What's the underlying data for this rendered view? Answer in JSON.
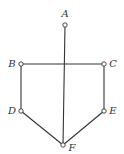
{
  "diagram": {
    "type": "graph",
    "nodes": [
      {
        "id": "A",
        "label": "A",
        "x": 65,
        "y": 25,
        "lx": 65,
        "ly": 17
      },
      {
        "id": "B",
        "label": "B",
        "x": 21,
        "y": 64,
        "lx": 12,
        "ly": 67
      },
      {
        "id": "C",
        "label": "C",
        "x": 104,
        "y": 64,
        "lx": 113,
        "ly": 67
      },
      {
        "id": "D",
        "label": "D",
        "x": 21,
        "y": 111,
        "lx": 12,
        "ly": 114
      },
      {
        "id": "E",
        "label": "E",
        "x": 104,
        "y": 111,
        "lx": 113,
        "ly": 114
      },
      {
        "id": "F",
        "label": "F",
        "x": 63,
        "y": 145,
        "lx": 72,
        "ly": 151
      }
    ],
    "edges": [
      {
        "from": "A",
        "to": "F"
      },
      {
        "from": "B",
        "to": "C"
      },
      {
        "from": "B",
        "to": "D"
      },
      {
        "from": "C",
        "to": "E"
      },
      {
        "from": "D",
        "to": "F"
      },
      {
        "from": "E",
        "to": "F"
      }
    ]
  }
}
